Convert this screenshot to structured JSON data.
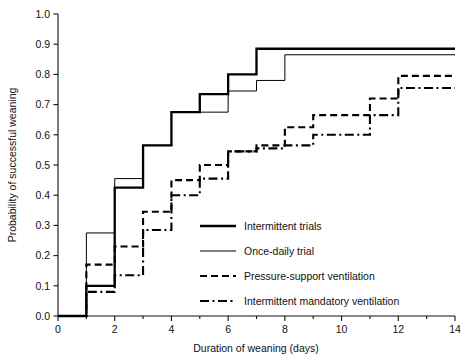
{
  "chart_data": {
    "type": "line",
    "subtype": "kaplan-meier-step",
    "title": "",
    "xlabel": "Duration of weaning (days)",
    "ylabel": "Probability of successful weaning",
    "xlim": [
      0,
      14
    ],
    "ylim": [
      0.0,
      1.0
    ],
    "xticks": [
      0,
      2,
      4,
      6,
      8,
      10,
      12,
      14
    ],
    "xtick_labels": [
      "0",
      "2",
      "4",
      "6",
      "8",
      "10",
      "12",
      "14"
    ],
    "xminor_ticks": [
      1,
      3,
      5,
      7,
      9,
      11,
      13
    ],
    "yticks": [
      0.0,
      0.1,
      0.2,
      0.3,
      0.4,
      0.5,
      0.6,
      0.7,
      0.8,
      0.9,
      1.0
    ],
    "ytick_labels": [
      "0.0",
      "0.1",
      "0.2",
      "0.3",
      "0.4",
      "0.5",
      "0.6",
      "0.7",
      "0.8",
      "0.9",
      "1.0"
    ],
    "grid": false,
    "legend_position": "inside-lower-right",
    "series": [
      {
        "name": "Intermittent trials",
        "style": "solid-thick",
        "stroke_width": 2.3,
        "dash": "none",
        "color": "#000000",
        "x": [
          0,
          1,
          1,
          2,
          2,
          3,
          3,
          4,
          4,
          5,
          5,
          6,
          6,
          7,
          7,
          14
        ],
        "y": [
          0.0,
          0.0,
          0.1,
          0.1,
          0.425,
          0.425,
          0.565,
          0.565,
          0.675,
          0.675,
          0.735,
          0.735,
          0.8,
          0.8,
          0.885,
          0.885
        ]
      },
      {
        "name": "Once-daily trial",
        "style": "solid-thin",
        "stroke_width": 1.0,
        "dash": "none",
        "color": "#000000",
        "x": [
          0,
          1,
          1,
          2,
          2,
          3,
          3,
          4,
          4,
          5,
          5,
          6,
          6,
          7,
          7,
          8,
          8,
          14
        ],
        "y": [
          0.0,
          0.0,
          0.275,
          0.275,
          0.455,
          0.455,
          0.565,
          0.565,
          0.675,
          0.675,
          0.675,
          0.675,
          0.745,
          0.745,
          0.78,
          0.78,
          0.865,
          0.865
        ]
      },
      {
        "name": "Pressure-support ventilation",
        "style": "dashed",
        "stroke_width": 2.1,
        "dash": "7,4",
        "color": "#000000",
        "x": [
          0,
          1,
          1,
          2,
          2,
          3,
          3,
          4,
          4,
          5,
          5,
          6,
          6,
          7,
          7,
          8,
          8,
          9,
          9,
          11,
          11,
          12,
          12,
          14
        ],
        "y": [
          0.0,
          0.0,
          0.17,
          0.17,
          0.23,
          0.23,
          0.345,
          0.345,
          0.45,
          0.45,
          0.5,
          0.5,
          0.545,
          0.545,
          0.565,
          0.565,
          0.625,
          0.625,
          0.665,
          0.665,
          0.72,
          0.72,
          0.795,
          0.795
        ]
      },
      {
        "name": "Intermittent mandatory ventilation",
        "style": "dash-dot",
        "stroke_width": 2.1,
        "dash": "9,3.5,2,3.5",
        "color": "#000000",
        "x": [
          0,
          1,
          1,
          2,
          2,
          3,
          3,
          4,
          4,
          5,
          5,
          6,
          6,
          7,
          7,
          8,
          8,
          9,
          9,
          10,
          10,
          11,
          11,
          12,
          12,
          14
        ],
        "y": [
          0.0,
          0.0,
          0.08,
          0.08,
          0.135,
          0.135,
          0.285,
          0.285,
          0.4,
          0.4,
          0.455,
          0.455,
          0.545,
          0.545,
          0.555,
          0.555,
          0.565,
          0.565,
          0.6,
          0.6,
          0.6,
          0.6,
          0.665,
          0.665,
          0.755,
          0.755
        ]
      }
    ]
  },
  "legend": {
    "items": [
      {
        "label": "Intermittent trials",
        "key": "intermittent-trials"
      },
      {
        "label": "Once-daily trial",
        "key": "once-daily-trial"
      },
      {
        "label": "Pressure-support ventilation",
        "key": "pressure-support-ventilation"
      },
      {
        "label": "Intermittent mandatory ventilation",
        "key": "intermittent-mandatory-ventilation"
      }
    ]
  }
}
